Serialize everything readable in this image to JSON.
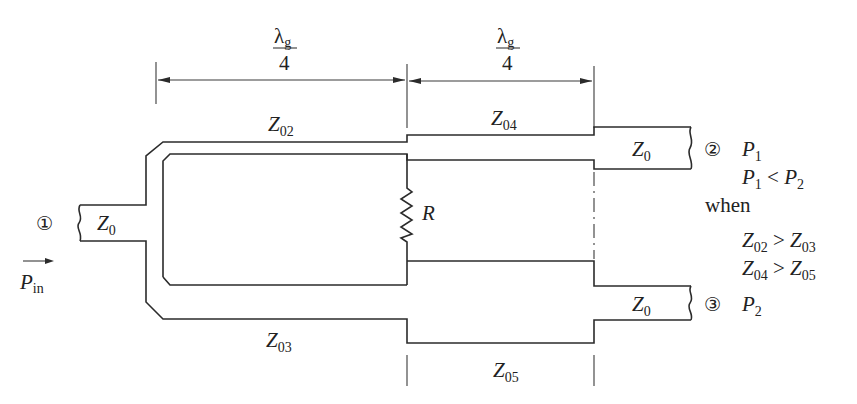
{
  "diagram": {
    "colors": {
      "line": "#2b2b2b",
      "background": "#ffffff"
    }
  },
  "dimensions": [
    {
      "numerator": "λ",
      "numerator_sub": "g",
      "denominator": "4"
    },
    {
      "numerator": "λ",
      "numerator_sub": "g",
      "denominator": "4"
    }
  ],
  "lines": {
    "z02": {
      "main": "Z",
      "sub": "02"
    },
    "z03": {
      "main": "Z",
      "sub": "03"
    },
    "z04": {
      "main": "Z",
      "sub": "04"
    },
    "z05": {
      "main": "Z",
      "sub": "05"
    }
  },
  "resistor": {
    "label": "R"
  },
  "ports": [
    {
      "number": "①",
      "impedance": {
        "main": "Z",
        "sub": "0"
      }
    },
    {
      "number": "②",
      "impedance": {
        "main": "Z",
        "sub": "0"
      },
      "power": {
        "main": "P",
        "sub": "1"
      }
    },
    {
      "number": "③",
      "impedance": {
        "main": "Z",
        "sub": "0"
      },
      "power": {
        "main": "P",
        "sub": "2"
      }
    }
  ],
  "input": {
    "arrow": "→",
    "main": "P",
    "sub": "in"
  },
  "conditions": {
    "relation": {
      "a": "P",
      "a_sub": "1",
      "op": " < ",
      "b": "P",
      "b_sub": "2"
    },
    "when": "when",
    "items": [
      {
        "a": "Z",
        "a_sub": "02",
        "op": " > ",
        "b": "Z",
        "b_sub": "03"
      },
      {
        "a": "Z",
        "a_sub": "04",
        "op": " > ",
        "b": "Z",
        "b_sub": "05"
      }
    ]
  }
}
